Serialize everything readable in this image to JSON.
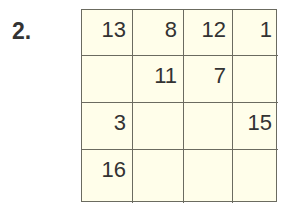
{
  "problem_number": "2.",
  "grid": {
    "rows": [
      [
        "13",
        "8",
        "12",
        "1"
      ],
      [
        "",
        "11",
        "7",
        ""
      ],
      [
        "3",
        "",
        "",
        "15"
      ],
      [
        "16",
        "",
        "",
        ""
      ]
    ]
  },
  "colors": {
    "cell_background": "#fffeea",
    "border": "#6b6b60",
    "text": "#333333"
  }
}
